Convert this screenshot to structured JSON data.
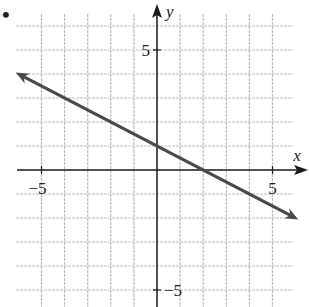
{
  "chart_data": {
    "type": "line",
    "title": "",
    "xlabel": "x",
    "ylabel": "y",
    "xlim": [
      -6,
      6
    ],
    "ylim": [
      -5.5,
      5.5
    ],
    "grid": true,
    "x_ticks": [
      {
        "value": -5,
        "label": "−5"
      },
      {
        "value": 5,
        "label": "5"
      }
    ],
    "y_ticks": [
      {
        "value": 5,
        "label": "5"
      },
      {
        "value": -5,
        "label": "−5"
      }
    ],
    "series": [
      {
        "name": "line",
        "equation": "y = -0.5x + 1",
        "slope": -0.5,
        "intercept": 1,
        "x": [
          -6,
          6
        ],
        "y": [
          4,
          -2
        ],
        "arrows": "both",
        "color": "#4a4a4a"
      }
    ]
  },
  "problem_marker": "•",
  "colors": {
    "grid": "#bdbdbd",
    "axis": "#1a1a1a",
    "line": "#4a4a4a"
  }
}
